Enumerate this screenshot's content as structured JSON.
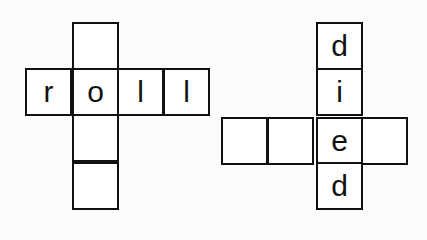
{
  "puzzles": [
    {
      "name": "roll",
      "cells": [
        {
          "x": 72,
          "y": 22,
          "letter": ""
        },
        {
          "x": 25,
          "y": 68,
          "letter": "r"
        },
        {
          "x": 72,
          "y": 68,
          "letter": "o"
        },
        {
          "x": 117,
          "y": 68,
          "letter": "l"
        },
        {
          "x": 163,
          "y": 68,
          "letter": "l"
        },
        {
          "x": 72,
          "y": 114,
          "letter": ""
        },
        {
          "x": 72,
          "y": 162,
          "letter": ""
        }
      ]
    },
    {
      "name": "died",
      "cells": [
        {
          "x": 316,
          "y": 22,
          "letter": "d"
        },
        {
          "x": 316,
          "y": 68,
          "letter": "i"
        },
        {
          "x": 221,
          "y": 117,
          "letter": ""
        },
        {
          "x": 267,
          "y": 117,
          "letter": ""
        },
        {
          "x": 316,
          "y": 117,
          "letter": "e"
        },
        {
          "x": 361,
          "y": 117,
          "letter": ""
        },
        {
          "x": 316,
          "y": 162,
          "letter": "d"
        }
      ]
    }
  ],
  "cell_size": {
    "w": 47,
    "h": 48
  }
}
